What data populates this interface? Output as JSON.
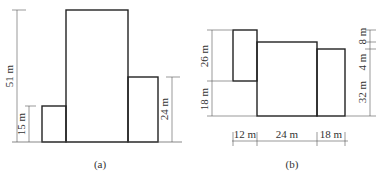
{
  "figure_a": {
    "caption": "(a)",
    "dims": {
      "total_height": "51 m",
      "left_block_height": "15 m",
      "right_block_height": "24 m"
    }
  },
  "figure_b": {
    "caption": "(b)",
    "dims": {
      "left_upper": "26 m",
      "left_lower": "18 m",
      "right_top": "8 m",
      "right_mid": "4 m",
      "right_main": "32 m",
      "bottom_left": "12 m",
      "bottom_mid": "24 m",
      "bottom_right": "18 m"
    }
  }
}
